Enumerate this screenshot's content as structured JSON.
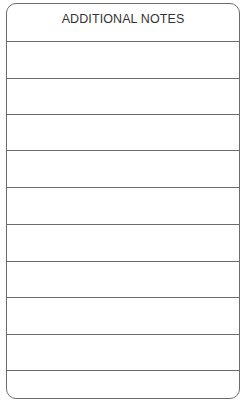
{
  "form": {
    "title": "ADDITIONAL NOTES",
    "line_count": 10,
    "border_color": "#6b6b6b"
  }
}
